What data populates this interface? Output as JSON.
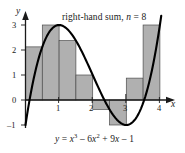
{
  "chart_data": {
    "type": "bar",
    "title": "right-hand sum, n = 8",
    "annotation": "y = x³ − 6x² + 9x − 1",
    "xlabel": "x",
    "ylabel": "y",
    "xlim": [
      0,
      4.2
    ],
    "ylim": [
      -1.3,
      3.3
    ],
    "grid": false,
    "legend": "none",
    "method": "right-hand Riemann sum",
    "n": 8,
    "dx": 0.5,
    "x_ticks": [
      1,
      2,
      3,
      4
    ],
    "y_ticks": [
      -1,
      0,
      1,
      2,
      3
    ],
    "bar_intervals": [
      [
        0.0,
        0.5
      ],
      [
        0.5,
        1.0
      ],
      [
        1.0,
        1.5
      ],
      [
        1.5,
        2.0
      ],
      [
        2.0,
        2.5
      ],
      [
        2.5,
        3.0
      ],
      [
        3.0,
        3.5
      ],
      [
        3.5,
        4.0
      ]
    ],
    "right_endpoints": [
      0.5,
      1.0,
      1.5,
      2.0,
      2.5,
      3.0,
      3.5,
      4.0
    ],
    "values": [
      2.125,
      3.0,
      2.375,
      1.0,
      -0.375,
      -1.0,
      0.875,
      3.0
    ],
    "categories": [
      "0.5",
      "1.0",
      "1.5",
      "2.0",
      "2.5",
      "3.0",
      "3.5",
      "4.0"
    ],
    "curve": {
      "label": "y = x³ − 6x² + 9x − 1",
      "coefficients": [
        1,
        -6,
        9,
        -1
      ]
    },
    "colors": {
      "bar_fill": "#b0b0b0",
      "bar_edge": "#4d4d4d",
      "curve": "#000000",
      "axis": "#1a1a1a"
    }
  },
  "axes": {
    "y_name": "y",
    "x_name": "x"
  },
  "tick_labels": {
    "y": [
      "3",
      "2",
      "1",
      "0",
      "–1"
    ],
    "x": [
      "1",
      "2",
      "3",
      "4"
    ]
  },
  "title_text": {
    "prefix": "right-hand sum, ",
    "var": "n",
    "equals": " = ",
    "value": "8"
  },
  "equation_text": {
    "lhs": "y",
    "eq": " = ",
    "t1_base": "x",
    "t1_exp": "3",
    "t2_op": " – 6",
    "t2_base": "x",
    "t2_exp": "2",
    "t3": " + 9",
    "t3_base": "x",
    "t4": " – 1"
  }
}
